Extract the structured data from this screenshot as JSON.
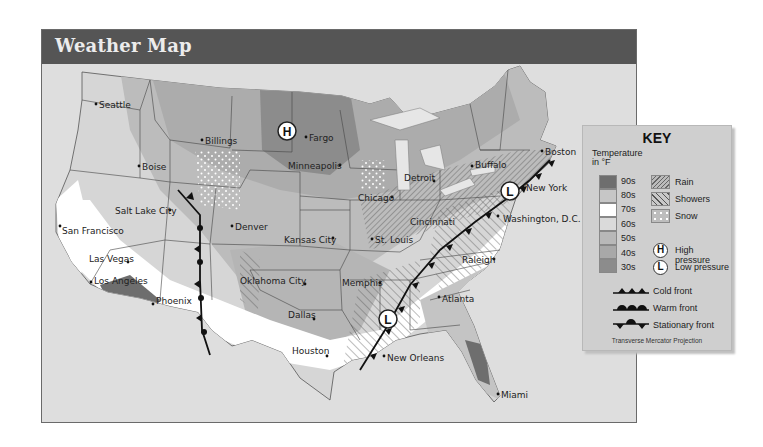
{
  "header": {
    "title": "Weather Map"
  },
  "colors": {
    "header_bg": "#555555",
    "frame_bg": "#dedede",
    "temp_90s": "#6e6e6e",
    "temp_80s": "#c6c6c6",
    "temp_70s": "#ffffff",
    "temp_60s": "#dadada",
    "temp_50s": "#b8b8b8",
    "temp_40s": "#a8a8a8",
    "temp_30s": "#8c8c8c"
  },
  "map": {
    "cities": [
      {
        "name": "Seattle",
        "x": 100,
        "y": 107
      },
      {
        "name": "Billings",
        "x": 204,
        "y": 143
      },
      {
        "name": "Fargo",
        "x": 307,
        "y": 140
      },
      {
        "name": "Boise",
        "x": 139,
        "y": 168
      },
      {
        "name": "Minneapolis",
        "x": 340,
        "y": 167
      },
      {
        "name": "Detroit",
        "x": 434,
        "y": 181
      },
      {
        "name": "Buffalo",
        "x": 472,
        "y": 166
      },
      {
        "name": "Boston",
        "x": 542,
        "y": 152
      },
      {
        "name": "New York",
        "x": 524,
        "y": 188
      },
      {
        "name": "Chicago",
        "x": 392,
        "y": 197
      },
      {
        "name": "Salt Lake City",
        "x": 170,
        "y": 212
      },
      {
        "name": "Denver",
        "x": 232,
        "y": 227
      },
      {
        "name": "Cincinnati",
        "x": 460,
        "y": 221
      },
      {
        "name": "Washington, D.C.",
        "x": 502,
        "y": 218
      },
      {
        "name": "San Francisco",
        "x": 60,
        "y": 230
      },
      {
        "name": "Kansas City",
        "x": 332,
        "y": 241
      },
      {
        "name": "St. Louis",
        "x": 372,
        "y": 240
      },
      {
        "name": "Las Vegas",
        "x": 100,
        "y": 258
      },
      {
        "name": "Raleigh",
        "x": 493,
        "y": 262
      },
      {
        "name": "Los Angeles",
        "x": 91,
        "y": 282
      },
      {
        "name": "Oklahoma City",
        "x": 303,
        "y": 283
      },
      {
        "name": "Memphis",
        "x": 380,
        "y": 283
      },
      {
        "name": "Atlanta",
        "x": 440,
        "y": 299
      },
      {
        "name": "Phoenix",
        "x": 149,
        "y": 302
      },
      {
        "name": "Dallas",
        "x": 305,
        "y": 318
      },
      {
        "name": "Houston",
        "x": 326,
        "y": 351
      },
      {
        "name": "New Orleans",
        "x": 383,
        "y": 356
      },
      {
        "name": "Miami",
        "x": 498,
        "y": 394
      }
    ],
    "pressure_centers": [
      {
        "type": "H",
        "x": 287,
        "y": 131
      },
      {
        "type": "L",
        "x": 510,
        "y": 191
      },
      {
        "type": "L",
        "x": 388,
        "y": 319
      }
    ]
  },
  "key": {
    "title": "KEY",
    "subtitle": "Temperature in °F",
    "temperature_bands": [
      {
        "label": "90s",
        "color": "#6e6e6e"
      },
      {
        "label": "80s",
        "color": "#c6c6c6"
      },
      {
        "label": "70s",
        "color": "#ffffff"
      },
      {
        "label": "60s",
        "color": "#dadada"
      },
      {
        "label": "50s",
        "color": "#b8b8b8"
      },
      {
        "label": "40s",
        "color": "#a8a8a8"
      },
      {
        "label": "30s",
        "color": "#8c8c8c"
      }
    ],
    "precipitation": [
      {
        "label": "Rain",
        "icon": "fine-hatch-pattern"
      },
      {
        "label": "Showers",
        "icon": "wide-hatch-pattern"
      },
      {
        "label": "Snow",
        "icon": "dot-pattern"
      }
    ],
    "pressure": [
      {
        "symbol": "H",
        "label": "High pressure"
      },
      {
        "symbol": "L",
        "label": "Low pressure"
      }
    ],
    "fronts": [
      {
        "label": "Cold front",
        "icon": "cold-front-triangles"
      },
      {
        "label": "Warm front",
        "icon": "warm-front-semicircles"
      },
      {
        "label": "Stationary front",
        "icon": "stationary-front-alternating"
      }
    ],
    "projection": "Transverse Mercator Projection"
  }
}
